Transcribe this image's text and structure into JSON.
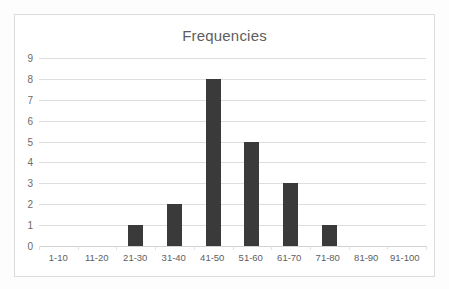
{
  "chart_data": {
    "type": "bar",
    "title": "Frequencies",
    "xlabel": "",
    "ylabel": "",
    "categories": [
      "1-10",
      "11-20",
      "21-30",
      "31-40",
      "41-50",
      "51-60",
      "61-70",
      "71-80",
      "81-90",
      "91-100"
    ],
    "values": [
      0,
      0,
      1,
      2,
      8,
      5,
      3,
      1,
      0,
      0
    ],
    "ylim": [
      0,
      9
    ],
    "yticks": [
      9,
      8,
      7,
      6,
      5,
      4,
      3,
      2,
      1,
      0
    ],
    "grid": true,
    "legend": false,
    "colors": {
      "bar": "#3a3a3a",
      "gridline": "#dedede",
      "title_text": "#5e5e5e",
      "tick_text": "#6b6b6b",
      "frame_border": "#dcdcdc",
      "plot_background": "#ffffff"
    }
  }
}
